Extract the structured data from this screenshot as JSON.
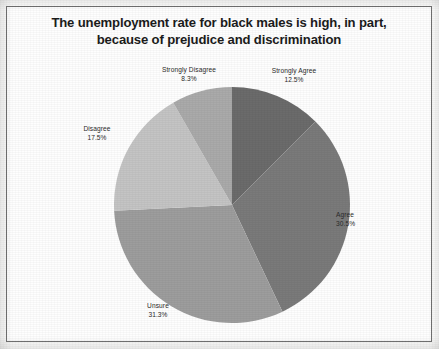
{
  "figure": {
    "title": "The unemployment rate for black males is high, in part,\nbecause of prejudice and discrimination",
    "border_color": "#6f6f6f",
    "background_color": "#fefefe"
  },
  "chart_data": {
    "type": "pie",
    "title": "The unemployment rate for black males is high, in part, because of prejudice and discrimination",
    "categories": [
      "Strongly Agree",
      "Agree",
      "Unsure",
      "Disagree",
      "Strongly Disagree"
    ],
    "values": [
      12.5,
      30.5,
      31.3,
      17.5,
      8.3
    ],
    "value_unit": "%",
    "labels": [
      {
        "name": "Strongly Agree",
        "percent": "12.5%",
        "color": "#6b6b6b"
      },
      {
        "name": "Agree",
        "percent": "30.5%",
        "color": "#7a7a7a"
      },
      {
        "name": "Unsure",
        "percent": "31.3%",
        "color": "#9d9d9d"
      },
      {
        "name": "Disagree",
        "percent": "17.5%",
        "color": "#c4c4c4"
      },
      {
        "name": "Strongly Disagree",
        "percent": "8.3%",
        "color": "#aaaaaa"
      }
    ],
    "start_angle_deg": 0,
    "direction": "clockwise",
    "legend": "none",
    "grid": false,
    "data_labels": "outside",
    "center": {
      "x": 232,
      "y": 205
    },
    "radius": 118
  },
  "slices": {
    "strongly_agree": {
      "name": "Strongly Agree",
      "percent": "12.5%"
    },
    "agree": {
      "name": "Agree",
      "percent": "30.5%"
    },
    "unsure": {
      "name": "Unsure",
      "percent": "31.3%"
    },
    "disagree": {
      "name": "Disagree",
      "percent": "17.5%"
    },
    "strongly_disagree": {
      "name": "Strongly Disagree",
      "percent": "8.3%"
    }
  }
}
